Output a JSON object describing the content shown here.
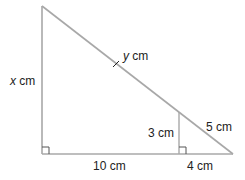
{
  "diagram": {
    "type": "similar-right-triangles",
    "colors": {
      "line": "#a8a8a8",
      "text": "#222222",
      "background": "#ffffff"
    },
    "labels": {
      "left_side_var": "x",
      "left_side_unit": " cm",
      "hypotenuse_var": "y",
      "hypotenuse_unit": " cm",
      "inner_height": "3 cm",
      "inner_hyp": "5 cm",
      "base_left": "10 cm",
      "base_right": "4 cm"
    },
    "markers": {
      "right_angles": [
        "bottom-left",
        "inner-foot"
      ],
      "tick_on_hypotenuse": true
    }
  }
}
